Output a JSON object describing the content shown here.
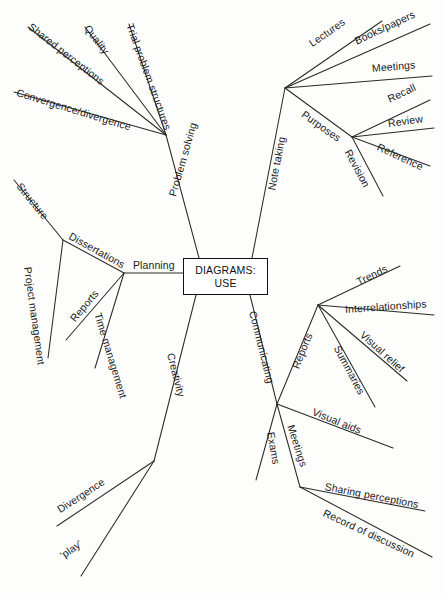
{
  "diagram": {
    "type": "mind-map",
    "title": "DIAGRAMS: USE",
    "center": {
      "line1": "DIAGRAMS:",
      "line2": "USE"
    },
    "ink_color": "#1b1b1b",
    "background_color": "#fdfdfc",
    "branches": [
      {
        "id": "problem-solving",
        "label": "Problem solving",
        "children": [
          {
            "id": "shared-perceptions",
            "label": "Shared perceptions"
          },
          {
            "id": "quality",
            "label": "Quality"
          },
          {
            "id": "trial-problem-structures",
            "label": "Trial problem structures"
          },
          {
            "id": "convergence-divergence",
            "label": "Convergence/divergence"
          }
        ]
      },
      {
        "id": "note-taking",
        "label": "Note taking",
        "children": [
          {
            "id": "lectures",
            "label": "Lectures"
          },
          {
            "id": "books-papers",
            "label": "Books/papers"
          },
          {
            "id": "meetings-notes",
            "label": "Meetings"
          },
          {
            "id": "purposes",
            "label": "Purposes",
            "children": [
              {
                "id": "recall",
                "label": "Recall"
              },
              {
                "id": "review",
                "label": "Review"
              },
              {
                "id": "reference",
                "label": "Reference"
              },
              {
                "id": "revision",
                "label": "Revision"
              }
            ]
          }
        ]
      },
      {
        "id": "planning",
        "label": "Planning",
        "children": [
          {
            "id": "dissertations",
            "label": "Dissertations",
            "children": [
              {
                "id": "structure",
                "label": "Structure"
              },
              {
                "id": "project-management",
                "label": "Project management"
              }
            ]
          },
          {
            "id": "reports-planning",
            "label": "Reports"
          },
          {
            "id": "time-management",
            "label": "Time management"
          }
        ]
      },
      {
        "id": "creativity",
        "label": "Creativity",
        "children": [
          {
            "id": "divergence",
            "label": "Divergence"
          },
          {
            "id": "play",
            "label": "'play'"
          }
        ]
      },
      {
        "id": "communicating",
        "label": "Communicating",
        "children": [
          {
            "id": "reports-communicating",
            "label": "Reports",
            "children": [
              {
                "id": "trends",
                "label": "Trends"
              },
              {
                "id": "interrelationships",
                "label": "Interrelationships"
              },
              {
                "id": "visual-relief",
                "label": "Visual relief"
              },
              {
                "id": "summaries",
                "label": "Summaries"
              }
            ]
          },
          {
            "id": "visual-aids",
            "label": "Visual aids"
          },
          {
            "id": "exams",
            "label": "Exams"
          },
          {
            "id": "meetings-communicating",
            "label": "Meetings",
            "children": [
              {
                "id": "sharing-perceptions",
                "label": "Sharing perceptions"
              },
              {
                "id": "record-of-discussion",
                "label": "Record of discussion"
              }
            ]
          }
        ]
      }
    ]
  }
}
